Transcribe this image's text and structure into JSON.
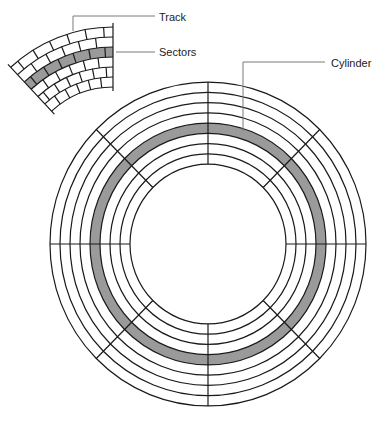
{
  "figure": {
    "labels": [
      {
        "id": "track",
        "text": "Track",
        "x": 159,
        "y": 11
      },
      {
        "id": "sectors",
        "text": "Sectors",
        "x": 159,
        "y": 46
      },
      {
        "id": "cylinder",
        "text": "Cylinder",
        "x": 331,
        "y": 57
      }
    ],
    "leaders": [
      {
        "id": "track-leader",
        "points": [
          [
            73,
            31
          ],
          [
            73,
            16
          ],
          [
            155,
            16
          ]
        ]
      },
      {
        "id": "sectors-leader",
        "points": [
          [
            116,
            52
          ],
          [
            155,
            52
          ]
        ]
      },
      {
        "id": "cylinder-leader",
        "points": [
          [
            325,
            62
          ],
          [
            243,
            62
          ],
          [
            243,
            131
          ]
        ]
      }
    ],
    "colors": {
      "stroke": "#1a1a1a",
      "highlight": "#9a9a9a",
      "leader": "#7a7a7a",
      "background": "#ffffff"
    }
  },
  "platter": {
    "cx": 208,
    "cy": 244,
    "y_scale": 1.025,
    "ring_radii": [
      158,
      148,
      138,
      128,
      118,
      108,
      98,
      88,
      78
    ],
    "highlight_band": {
      "outer": 118,
      "inner": 108
    },
    "sector_dividers_deg": [
      0,
      45,
      90,
      135,
      180,
      225,
      270,
      315
    ]
  },
  "inset": {
    "cx": 113,
    "cy": 177,
    "arc_radii": [
      150,
      140,
      130,
      120,
      110,
      100,
      90
    ],
    "highlight_track_index": 2,
    "start_deg": 227,
    "end_deg": 270,
    "sectors_per_track": 6
  }
}
